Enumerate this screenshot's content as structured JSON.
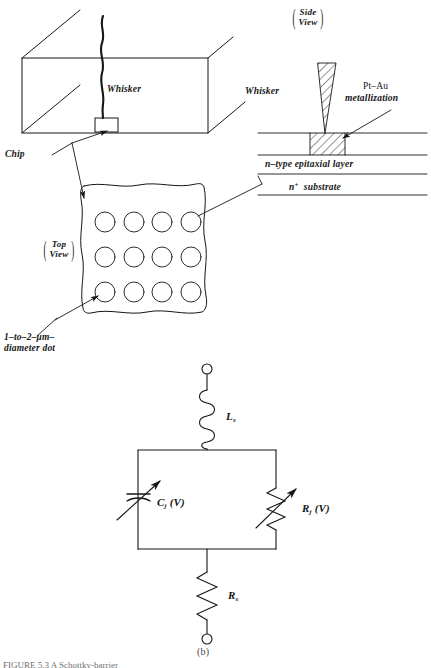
{
  "figure": {
    "domain": "Diagram",
    "panel_label": "(b)",
    "caption_partial": "FIGURE 5.3   A Schottky-barrier",
    "ink_color": "#161616",
    "background": "#ffffff"
  },
  "perspective_view": {
    "whisker_label": "Whisker",
    "chip_label": "Chip"
  },
  "side_view": {
    "view_tag_line1": "Side",
    "view_tag_line2": "View",
    "whisker_label": "Whisker",
    "metallization_label_line1": "Pt–Au",
    "metallization_label_line2": "metallization",
    "epitaxial_layer_label": "n–type  epitaxial  layer",
    "substrate_label_prefix": "n",
    "substrate_label_sup": "+",
    "substrate_label_suffix": "substrate"
  },
  "top_view": {
    "view_tag_line1": "Top",
    "view_tag_line2": "View",
    "dot_label_line1": "1–to–2–μm–",
    "dot_label_line2": "diameter  dot",
    "dot_grid_columns": 4,
    "dot_grid_rows": 3,
    "dot_count": 12
  },
  "circuit": {
    "inductor_label_base": "L",
    "inductor_label_sub": "s",
    "capacitor_label_base": "C",
    "capacitor_label_sub": "j",
    "capacitor_label_arg": "(V)",
    "junction_resistor_label_base": "R",
    "junction_resistor_label_sub": "j",
    "junction_resistor_label_arg": "(V)",
    "series_resistor_label_base": "R",
    "series_resistor_label_sub": "s",
    "terminal_top": "open-terminal",
    "terminal_bottom": "open-terminal"
  }
}
